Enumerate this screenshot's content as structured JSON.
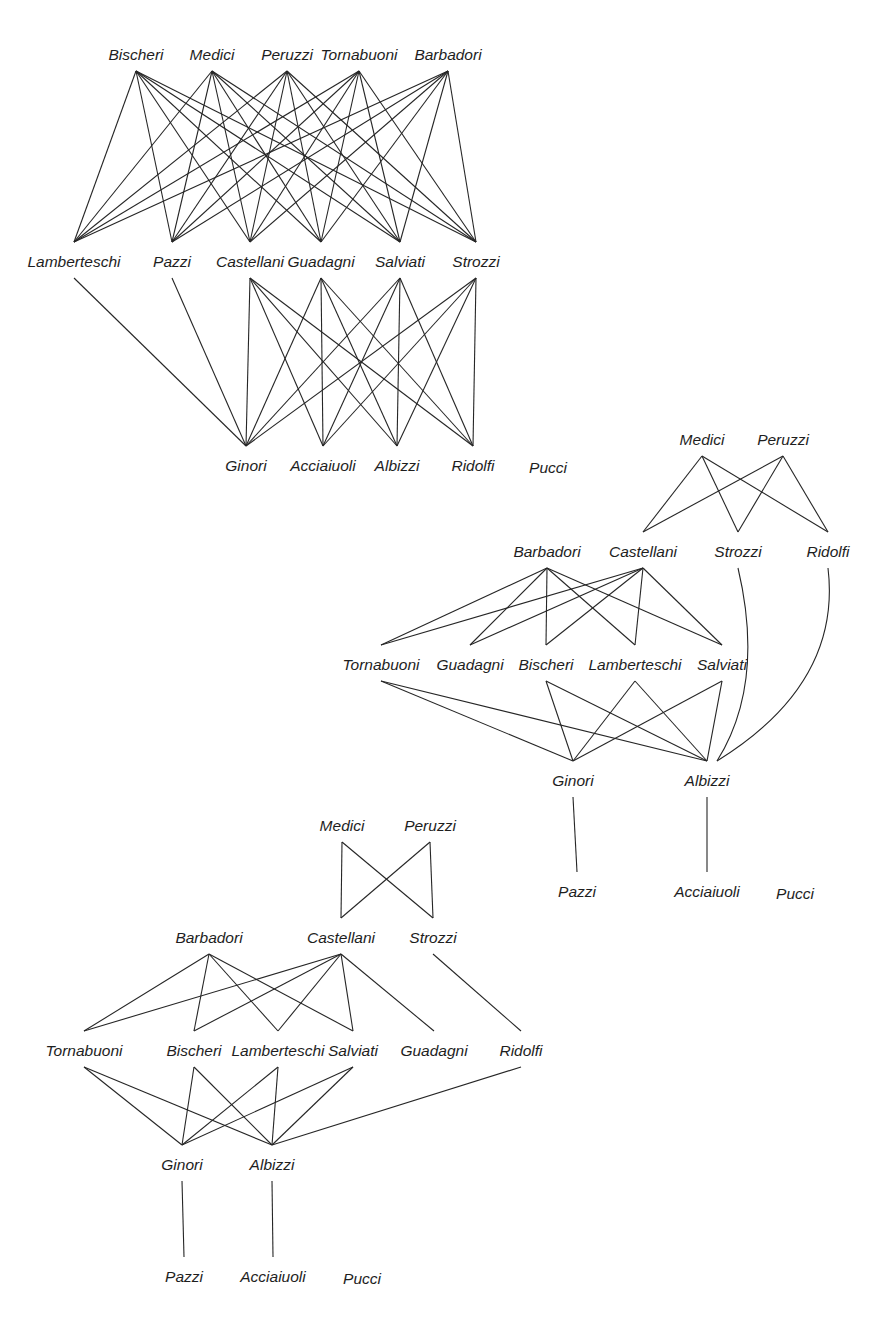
{
  "colors": {
    "line": "#262626",
    "text": "#1e1e1e",
    "background": "#ffffff"
  },
  "diagrams": [
    {
      "id": "diagram-1",
      "nodes": [
        {
          "id": "bischeri_t",
          "label": "Bischeri",
          "x": 136,
          "y": 55
        },
        {
          "id": "medici_t",
          "label": "Medici",
          "x": 212,
          "y": 55
        },
        {
          "id": "peruzzi_t",
          "label": "Peruzzi",
          "x": 287,
          "y": 55
        },
        {
          "id": "tornabuoni_t",
          "label": "Tornabuoni",
          "x": 359,
          "y": 55
        },
        {
          "id": "barbadori_t",
          "label": "Barbadori",
          "x": 448,
          "y": 55
        },
        {
          "id": "lamberteschi_m",
          "label": "Lamberteschi",
          "x": 74,
          "y": 262
        },
        {
          "id": "pazzi_m",
          "label": "Pazzi",
          "x": 172,
          "y": 262
        },
        {
          "id": "castellani_m",
          "label": "Castellani",
          "x": 250,
          "y": 262
        },
        {
          "id": "guadagni_m",
          "label": "Guadagni",
          "x": 321,
          "y": 262
        },
        {
          "id": "salviati_m",
          "label": "Salviati",
          "x": 400,
          "y": 262
        },
        {
          "id": "strozzi_m",
          "label": "Strozzi",
          "x": 476,
          "y": 262
        },
        {
          "id": "ginori_b",
          "label": "Ginori",
          "x": 246,
          "y": 466
        },
        {
          "id": "acciaiuoli_b",
          "label": "Acciaiuoli",
          "x": 323,
          "y": 466
        },
        {
          "id": "albizzi_b",
          "label": "Albizzi",
          "x": 397,
          "y": 466
        },
        {
          "id": "ridolfi_b",
          "label": "Ridolfi",
          "x": 473,
          "y": 466
        },
        {
          "id": "pucci_b",
          "label": "Pucci",
          "x": 548,
          "y": 468
        }
      ],
      "edges": [
        [
          "bischeri_t",
          "lamberteschi_m"
        ],
        [
          "bischeri_t",
          "pazzi_m"
        ],
        [
          "bischeri_t",
          "castellani_m"
        ],
        [
          "bischeri_t",
          "guadagni_m"
        ],
        [
          "bischeri_t",
          "salviati_m"
        ],
        [
          "bischeri_t",
          "strozzi_m"
        ],
        [
          "medici_t",
          "lamberteschi_m"
        ],
        [
          "medici_t",
          "pazzi_m"
        ],
        [
          "medici_t",
          "castellani_m"
        ],
        [
          "medici_t",
          "guadagni_m"
        ],
        [
          "medici_t",
          "salviati_m"
        ],
        [
          "medici_t",
          "strozzi_m"
        ],
        [
          "peruzzi_t",
          "lamberteschi_m"
        ],
        [
          "peruzzi_t",
          "pazzi_m"
        ],
        [
          "peruzzi_t",
          "castellani_m"
        ],
        [
          "peruzzi_t",
          "guadagni_m"
        ],
        [
          "peruzzi_t",
          "salviati_m"
        ],
        [
          "peruzzi_t",
          "strozzi_m"
        ],
        [
          "tornabuoni_t",
          "lamberteschi_m"
        ],
        [
          "tornabuoni_t",
          "pazzi_m"
        ],
        [
          "tornabuoni_t",
          "castellani_m"
        ],
        [
          "tornabuoni_t",
          "guadagni_m"
        ],
        [
          "tornabuoni_t",
          "salviati_m"
        ],
        [
          "tornabuoni_t",
          "strozzi_m"
        ],
        [
          "barbadori_t",
          "lamberteschi_m"
        ],
        [
          "barbadori_t",
          "pazzi_m"
        ],
        [
          "barbadori_t",
          "castellani_m"
        ],
        [
          "barbadori_t",
          "guadagni_m"
        ],
        [
          "barbadori_t",
          "salviati_m"
        ],
        [
          "barbadori_t",
          "strozzi_m"
        ],
        [
          "lamberteschi_m",
          "ginori_b"
        ],
        [
          "pazzi_m",
          "ginori_b"
        ],
        [
          "castellani_m",
          "ginori_b"
        ],
        [
          "castellani_m",
          "acciaiuoli_b"
        ],
        [
          "castellani_m",
          "albizzi_b"
        ],
        [
          "castellani_m",
          "ridolfi_b"
        ],
        [
          "guadagni_m",
          "ginori_b"
        ],
        [
          "guadagni_m",
          "acciaiuoli_b"
        ],
        [
          "guadagni_m",
          "albizzi_b"
        ],
        [
          "guadagni_m",
          "ridolfi_b"
        ],
        [
          "salviati_m",
          "ginori_b"
        ],
        [
          "salviati_m",
          "acciaiuoli_b"
        ],
        [
          "salviati_m",
          "albizzi_b"
        ],
        [
          "salviati_m",
          "ridolfi_b"
        ],
        [
          "strozzi_m",
          "ginori_b"
        ],
        [
          "strozzi_m",
          "acciaiuoli_b"
        ],
        [
          "strozzi_m",
          "albizzi_b"
        ],
        [
          "strozzi_m",
          "ridolfi_b"
        ]
      ]
    },
    {
      "id": "diagram-2",
      "nodes": [
        {
          "id": "medici",
          "label": "Medici",
          "x": 702,
          "y": 440
        },
        {
          "id": "peruzzi",
          "label": "Peruzzi",
          "x": 783,
          "y": 440
        },
        {
          "id": "barbadori",
          "label": "Barbadori",
          "x": 547,
          "y": 552
        },
        {
          "id": "castellani",
          "label": "Castellani",
          "x": 643,
          "y": 552
        },
        {
          "id": "strozzi",
          "label": "Strozzi",
          "x": 738,
          "y": 552
        },
        {
          "id": "ridolfi",
          "label": "Ridolfi",
          "x": 828,
          "y": 552
        },
        {
          "id": "tornabuoni",
          "label": "Tornabuoni",
          "x": 381,
          "y": 665
        },
        {
          "id": "guadagni",
          "label": "Guadagni",
          "x": 470,
          "y": 665
        },
        {
          "id": "bischeri",
          "label": "Bischeri",
          "x": 546,
          "y": 665
        },
        {
          "id": "lamberteschi",
          "label": "Lamberteschi",
          "x": 635,
          "y": 665
        },
        {
          "id": "salviati",
          "label": "Salviati",
          "x": 722,
          "y": 665
        },
        {
          "id": "ginori",
          "label": "Ginori",
          "x": 573,
          "y": 781
        },
        {
          "id": "albizzi",
          "label": "Albizzi",
          "x": 707,
          "y": 781
        },
        {
          "id": "pazzi",
          "label": "Pazzi",
          "x": 577,
          "y": 892
        },
        {
          "id": "acciaiuoli",
          "label": "Acciaiuoli",
          "x": 707,
          "y": 892
        },
        {
          "id": "pucci",
          "label": "Pucci",
          "x": 795,
          "y": 894
        }
      ],
      "edges": [
        [
          "medici",
          "castellani"
        ],
        [
          "medici",
          "strozzi"
        ],
        [
          "medici",
          "ridolfi"
        ],
        [
          "peruzzi",
          "castellani"
        ],
        [
          "peruzzi",
          "strozzi"
        ],
        [
          "peruzzi",
          "ridolfi"
        ],
        [
          "barbadori",
          "tornabuoni"
        ],
        [
          "barbadori",
          "guadagni"
        ],
        [
          "barbadori",
          "bischeri"
        ],
        [
          "barbadori",
          "lamberteschi"
        ],
        [
          "barbadori",
          "salviati"
        ],
        [
          "castellani",
          "tornabuoni"
        ],
        [
          "castellani",
          "guadagni"
        ],
        [
          "castellani",
          "bischeri"
        ],
        [
          "castellani",
          "lamberteschi"
        ],
        [
          "castellani",
          "salviati"
        ],
        [
          "tornabuoni",
          "ginori"
        ],
        [
          "tornabuoni",
          "albizzi"
        ],
        [
          "bischeri",
          "ginori"
        ],
        [
          "bischeri",
          "albizzi"
        ],
        [
          "lamberteschi",
          "ginori"
        ],
        [
          "lamberteschi",
          "albizzi"
        ],
        [
          "salviati",
          "ginori"
        ],
        [
          "salviati",
          "albizzi"
        ],
        [
          "strozzi",
          "albizzi",
          "curve"
        ],
        [
          "ridolfi",
          "albizzi",
          "curve"
        ],
        [
          "ginori",
          "pazzi"
        ],
        [
          "albizzi",
          "acciaiuoli"
        ]
      ]
    },
    {
      "id": "diagram-3",
      "nodes": [
        {
          "id": "medici",
          "label": "Medici",
          "x": 342,
          "y": 826
        },
        {
          "id": "peruzzi",
          "label": "Peruzzi",
          "x": 430,
          "y": 826
        },
        {
          "id": "barbadori",
          "label": "Barbadori",
          "x": 209,
          "y": 938
        },
        {
          "id": "castellani",
          "label": "Castellani",
          "x": 341,
          "y": 938
        },
        {
          "id": "strozzi",
          "label": "Strozzi",
          "x": 433,
          "y": 938
        },
        {
          "id": "tornabuoni",
          "label": "Tornabuoni",
          "x": 84,
          "y": 1051
        },
        {
          "id": "bischeri",
          "label": "Bischeri",
          "x": 194,
          "y": 1051
        },
        {
          "id": "lamberteschi",
          "label": "Lamberteschi",
          "x": 278,
          "y": 1051
        },
        {
          "id": "salviati",
          "label": "Salviati",
          "x": 353,
          "y": 1051
        },
        {
          "id": "guadagni",
          "label": "Guadagni",
          "x": 434,
          "y": 1051
        },
        {
          "id": "ridolfi",
          "label": "Ridolfi",
          "x": 521,
          "y": 1051
        },
        {
          "id": "ginori",
          "label": "Ginori",
          "x": 182,
          "y": 1165
        },
        {
          "id": "albizzi",
          "label": "Albizzi",
          "x": 272,
          "y": 1165
        },
        {
          "id": "pazzi",
          "label": "Pazzi",
          "x": 184,
          "y": 1277
        },
        {
          "id": "acciaiuoli",
          "label": "Acciaiuoli",
          "x": 273,
          "y": 1277
        },
        {
          "id": "pucci",
          "label": "Pucci",
          "x": 362,
          "y": 1279
        }
      ],
      "edges": [
        [
          "medici",
          "castellani"
        ],
        [
          "medici",
          "strozzi"
        ],
        [
          "peruzzi",
          "castellani"
        ],
        [
          "peruzzi",
          "strozzi"
        ],
        [
          "barbadori",
          "tornabuoni"
        ],
        [
          "barbadori",
          "bischeri"
        ],
        [
          "barbadori",
          "lamberteschi"
        ],
        [
          "barbadori",
          "salviati"
        ],
        [
          "castellani",
          "tornabuoni"
        ],
        [
          "castellani",
          "bischeri"
        ],
        [
          "castellani",
          "lamberteschi"
        ],
        [
          "castellani",
          "salviati"
        ],
        [
          "castellani",
          "guadagni"
        ],
        [
          "strozzi",
          "ridolfi"
        ],
        [
          "tornabuoni",
          "ginori"
        ],
        [
          "tornabuoni",
          "albizzi"
        ],
        [
          "bischeri",
          "ginori"
        ],
        [
          "bischeri",
          "albizzi"
        ],
        [
          "lamberteschi",
          "ginori"
        ],
        [
          "lamberteschi",
          "albizzi"
        ],
        [
          "salviati",
          "ginori"
        ],
        [
          "salviati",
          "albizzi"
        ],
        [
          "ridolfi",
          "albizzi"
        ],
        [
          "ginori",
          "pazzi"
        ],
        [
          "albizzi",
          "acciaiuoli"
        ]
      ]
    }
  ]
}
